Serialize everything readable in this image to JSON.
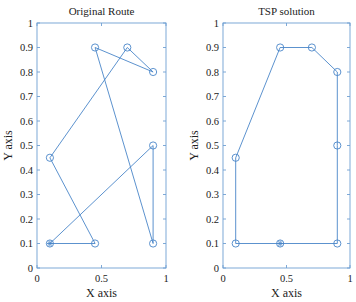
{
  "chart_data": [
    {
      "type": "line",
      "title": "Original Route",
      "xlabel": "X axis",
      "ylabel": "Y axis",
      "xlim": [
        0,
        1
      ],
      "ylim": [
        0,
        1
      ],
      "xticks": [
        "0",
        "0.5",
        "1"
      ],
      "yticks": [
        "0",
        "0.1",
        "0.2",
        "0.3",
        "0.4",
        "0.5",
        "0.6",
        "0.7",
        "0.8",
        "0.9",
        "1"
      ],
      "grid": false,
      "marker": "o",
      "start_point": [
        0.1,
        0.1
      ],
      "route": [
        [
          0.1,
          0.1
        ],
        [
          0.45,
          0.1
        ],
        [
          0.1,
          0.45
        ],
        [
          0.7,
          0.9
        ],
        [
          0.9,
          0.8
        ],
        [
          0.45,
          0.9
        ],
        [
          0.9,
          0.1
        ],
        [
          0.9,
          0.5
        ],
        [
          0.1,
          0.1
        ]
      ]
    },
    {
      "type": "line",
      "title": "TSP solution",
      "xlabel": "X axis",
      "ylabel": "Y axis",
      "xlim": [
        0,
        1
      ],
      "ylim": [
        0,
        1
      ],
      "xticks": [
        "0",
        "0.5",
        "1"
      ],
      "yticks": [
        "0",
        "0.1",
        "0.2",
        "0.3",
        "0.4",
        "0.5",
        "0.6",
        "0.7",
        "0.8",
        "0.9",
        "1"
      ],
      "grid": false,
      "marker": "o",
      "start_point": [
        0.45,
        0.1
      ],
      "route": [
        [
          0.45,
          0.1
        ],
        [
          0.1,
          0.1
        ],
        [
          0.1,
          0.45
        ],
        [
          0.45,
          0.9
        ],
        [
          0.7,
          0.9
        ],
        [
          0.9,
          0.8
        ],
        [
          0.9,
          0.5
        ],
        [
          0.9,
          0.1
        ],
        [
          0.45,
          0.1
        ]
      ]
    }
  ],
  "plots": [
    {
      "title": "Original Route",
      "xlabel": "X axis",
      "ylabel": "Y axis"
    },
    {
      "title": "TSP solution",
      "xlabel": "X axis",
      "ylabel": "Y axis"
    }
  ],
  "colors": {
    "line": "#4a86c8",
    "frame": "#6f9fd2"
  }
}
